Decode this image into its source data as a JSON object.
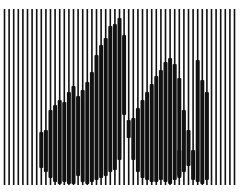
{
  "artwork": {
    "description": "Vertical line-screen image with thickened segments revealing a figure",
    "colors": {
      "background": "#ffffff",
      "ink": "#111111"
    },
    "lines": {
      "count": 51,
      "x_start": 4.5,
      "pitch": 4.6,
      "y_top": 9,
      "y_bottom": 185,
      "thin_width": 1.6,
      "thick_width": 4.0
    },
    "thick_segments": [
      [],
      [],
      [],
      [],
      [],
      [],
      [],
      [],
      [
        [
          132,
          168
        ]
      ],
      [
        [
          130,
          172
        ]
      ],
      [
        [
          110,
          178
        ]
      ],
      [
        [
          105,
          182
        ]
      ],
      [
        [
          100,
          184
        ]
      ],
      [
        [
          102,
          182
        ]
      ],
      [
        [
          92,
          184
        ]
      ],
      [
        [
          86,
          184
        ]
      ],
      [
        [
          96,
          176
        ]
      ],
      [
        [
          90,
          182
        ]
      ],
      [
        [
          82,
          184
        ]
      ],
      [
        [
          72,
          182
        ]
      ],
      [
        [
          55,
          180
        ]
      ],
      [
        [
          45,
          178
        ]
      ],
      [
        [
          38,
          176
        ]
      ],
      [
        [
          26,
          172
        ]
      ],
      [
        [
          24,
          170
        ]
      ],
      [
        [
          18,
          160
        ]
      ],
      [
        [
          35,
          115
        ]
      ],
      [
        [
          120,
          138
        ]
      ],
      [
        [
          118,
          160
        ]
      ],
      [
        [
          108,
          172
        ]
      ],
      [
        [
          100,
          178
        ]
      ],
      [
        [
          92,
          180
        ]
      ],
      [
        [
          84,
          182
        ]
      ],
      [
        [
          76,
          182
        ]
      ],
      [
        [
          70,
          180
        ]
      ],
      [
        [
          62,
          182
        ]
      ],
      [
        [
          58,
          184
        ]
      ],
      [
        [
          64,
          180
        ]
      ],
      [
        [
          78,
          176
        ],
        [
          150,
          178
        ]
      ],
      [
        [
          110,
          172
        ]
      ],
      [
        [
          130,
          166
        ]
      ],
      [
        [
          150,
          180
        ]
      ],
      [
        [
          60,
          182
        ]
      ],
      [
        [
          80,
          184
        ]
      ],
      [
        [
          92,
          180
        ]
      ],
      [],
      [],
      [],
      [],
      [],
      []
    ]
  }
}
